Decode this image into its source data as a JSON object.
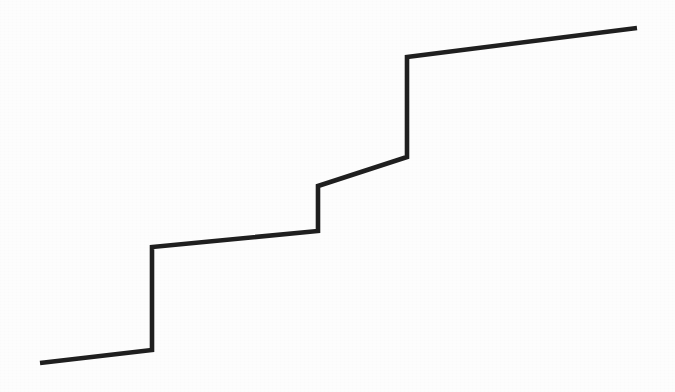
{
  "figure": {
    "background_color": "#fdfdfd",
    "width": 675,
    "height": 392
  },
  "chart_data": {
    "type": "line",
    "title": "",
    "subtitle": "",
    "xlabel": "",
    "ylabel": "",
    "grid": false,
    "legend": null,
    "axis_visible": false,
    "tick_labels_x": [],
    "tick_labels_y": [],
    "xlim": [
      0,
      675
    ],
    "ylim": [
      392,
      0
    ],
    "series": [
      {
        "name": "staircase-profile",
        "color": "#1f1f1f",
        "stroke_width": 4.6,
        "points": [
          {
            "x": 40,
            "y": 363
          },
          {
            "x": 152,
            "y": 350
          },
          {
            "x": 152,
            "y": 247
          },
          {
            "x": 318,
            "y": 231
          },
          {
            "x": 318,
            "y": 186
          },
          {
            "x": 407,
            "y": 157
          },
          {
            "x": 407,
            "y": 57
          },
          {
            "x": 637,
            "y": 28
          }
        ],
        "path": "M 40 363 L 152 350 L 152 247 L 318 231 L 318 186 L 407 157 L 407 57 L 637 28"
      }
    ],
    "segments": [
      {
        "name": "tread-1",
        "orientation": "horizontal",
        "from": [
          40,
          363
        ],
        "to": [
          152,
          350
        ],
        "length_x": 112,
        "rise": 13
      },
      {
        "name": "riser-1",
        "orientation": "vertical",
        "from": [
          152,
          350
        ],
        "to": [
          152,
          247
        ],
        "length_x": 0,
        "rise": 103
      },
      {
        "name": "tread-2",
        "orientation": "horizontal",
        "from": [
          152,
          247
        ],
        "to": [
          318,
          231
        ],
        "length_x": 166,
        "rise": 16
      },
      {
        "name": "riser-2",
        "orientation": "vertical",
        "from": [
          318,
          231
        ],
        "to": [
          318,
          186
        ],
        "length_x": 0,
        "rise": 45
      },
      {
        "name": "tread-3",
        "orientation": "horizontal",
        "from": [
          318,
          186
        ],
        "to": [
          407,
          157
        ],
        "length_x": 89,
        "rise": 29
      },
      {
        "name": "riser-3",
        "orientation": "vertical",
        "from": [
          407,
          157
        ],
        "to": [
          407,
          57
        ],
        "length_x": 0,
        "rise": 100
      },
      {
        "name": "tread-4",
        "orientation": "horizontal",
        "from": [
          407,
          57
        ],
        "to": [
          637,
          28
        ],
        "length_x": 230,
        "rise": 29
      }
    ]
  }
}
